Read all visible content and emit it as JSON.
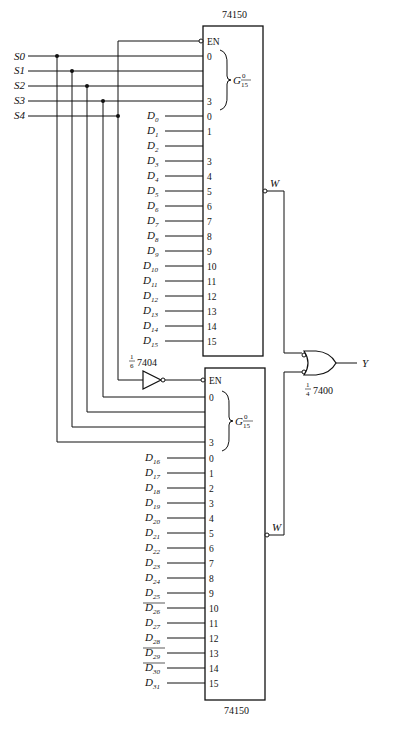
{
  "diagram": {
    "type": "logic-circuit",
    "select_inputs": [
      "S0",
      "S1",
      "S2",
      "S3",
      "S4"
    ],
    "upper_mux": {
      "part": "74150",
      "enable_label": "EN",
      "group_label": "G",
      "group_sup": "0",
      "group_sub": "15",
      "select_pins": [
        "0",
        "3"
      ],
      "output_label": "W",
      "data_inputs": [
        {
          "name": "D",
          "sub": "0",
          "pin": "0"
        },
        {
          "name": "D",
          "sub": "1",
          "pin": "1"
        },
        {
          "name": "D",
          "sub": "2",
          "pin": ""
        },
        {
          "name": "D",
          "sub": "3",
          "pin": "3"
        },
        {
          "name": "D",
          "sub": "4",
          "pin": "4"
        },
        {
          "name": "D",
          "sub": "5",
          "pin": "5"
        },
        {
          "name": "D",
          "sub": "6",
          "pin": "6"
        },
        {
          "name": "D",
          "sub": "7",
          "pin": "7"
        },
        {
          "name": "D",
          "sub": "8",
          "pin": "8"
        },
        {
          "name": "D",
          "sub": "9",
          "pin": "9"
        },
        {
          "name": "D",
          "sub": "10",
          "pin": "10"
        },
        {
          "name": "D",
          "sub": "11",
          "pin": "11"
        },
        {
          "name": "D",
          "sub": "12",
          "pin": "12"
        },
        {
          "name": "D",
          "sub": "13",
          "pin": "13"
        },
        {
          "name": "D",
          "sub": "14",
          "pin": "14"
        },
        {
          "name": "D",
          "sub": "15",
          "pin": "15"
        }
      ]
    },
    "lower_mux": {
      "part": "74150",
      "enable_label": "EN",
      "group_label": "G",
      "group_sup": "0",
      "group_sub": "15",
      "select_pins": [
        "0",
        "3"
      ],
      "output_label": "W",
      "data_inputs": [
        {
          "name": "D",
          "sub": "16",
          "pin": "0"
        },
        {
          "name": "D",
          "sub": "17",
          "pin": "1"
        },
        {
          "name": "D",
          "sub": "18",
          "pin": "2"
        },
        {
          "name": "D",
          "sub": "19",
          "pin": "3"
        },
        {
          "name": "D",
          "sub": "20",
          "pin": "4"
        },
        {
          "name": "D",
          "sub": "21",
          "pin": "5"
        },
        {
          "name": "D",
          "sub": "22",
          "pin": "6"
        },
        {
          "name": "D",
          "sub": "23",
          "pin": "7"
        },
        {
          "name": "D",
          "sub": "24",
          "pin": "8"
        },
        {
          "name": "D",
          "sub": "25",
          "pin": "9"
        },
        {
          "name": "D",
          "sub": "26",
          "pin": "10"
        },
        {
          "name": "D",
          "sub": "27",
          "pin": "11"
        },
        {
          "name": "D",
          "sub": "28",
          "pin": "12"
        },
        {
          "name": "D",
          "sub": "29",
          "pin": "13"
        },
        {
          "name": "D",
          "sub": "30",
          "pin": "14"
        },
        {
          "name": "D",
          "sub": "31",
          "pin": "15"
        }
      ]
    },
    "inverter": {
      "fraction_num": "1",
      "fraction_den": "6",
      "part": "7404"
    },
    "nand_gate": {
      "fraction_num": "1",
      "fraction_den": "4",
      "part": "7400"
    },
    "output_label": "Y"
  }
}
